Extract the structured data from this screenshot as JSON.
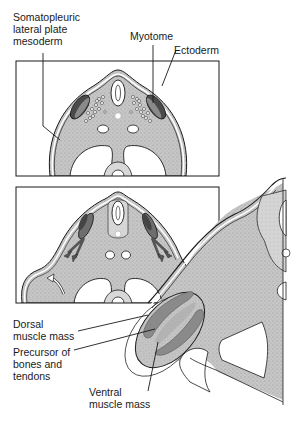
{
  "figure": {
    "panels": [
      {
        "id": "upper",
        "caption": "Transverse section, somite stage"
      },
      {
        "id": "lower",
        "caption": "Transverse section with limb bud"
      }
    ]
  },
  "labels": {
    "somatopleuric": "Somatopleuric\nlateral plate\nmesoderm",
    "myotome": "Myotome",
    "ectoderm": "Ectoderm",
    "dorsal": "Dorsal\nmuscle mass",
    "precursor": "Precursor of\nbones and\ntendons",
    "ventral": "Ventral\nmuscle mass"
  },
  "colors": {
    "tissue_fill": "#c4c4c4",
    "myotome_dark": "#555555",
    "muscle_mass": "#8a8a8a",
    "outline": "#1a1a1a",
    "background": "#ffffff"
  }
}
